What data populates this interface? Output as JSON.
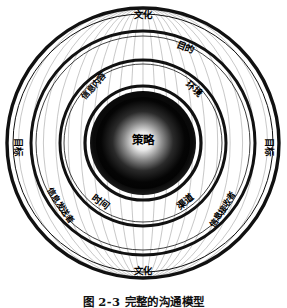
{
  "figure": {
    "title_caption": "图 2-3  完整的沟通模型",
    "core": {
      "label": "策略"
    },
    "rings": [
      {
        "id": "ring-outer",
        "labels": [
          {
            "name": "culture-top",
            "text": "文化",
            "angle_deg": -90,
            "radius": 128,
            "rotate": 0
          },
          {
            "name": "culture-bottom",
            "text": "文化",
            "angle_deg": 90,
            "radius": 128,
            "rotate": 0
          },
          {
            "name": "goal-left",
            "text": "目标",
            "angle_deg": 178,
            "radius": 126,
            "rotate": 90
          },
          {
            "name": "goal-right",
            "text": "目标",
            "angle_deg": 2,
            "radius": 126,
            "rotate": 90
          }
        ]
      },
      {
        "id": "ring-second",
        "labels": [
          {
            "name": "purpose",
            "text": "目的",
            "angle_deg": -66,
            "radius": 104,
            "rotate": 22
          },
          {
            "name": "message-sender",
            "text": "信息发送者",
            "angle_deg": 143,
            "radius": 104,
            "rotate": 56
          },
          {
            "name": "message-receiver",
            "text": "信息接收者",
            "angle_deg": 40,
            "radius": 104,
            "rotate": -56
          }
        ]
      },
      {
        "id": "ring-third",
        "labels": [
          {
            "name": "message-content",
            "text": "信息内容",
            "angle_deg": -131,
            "radius": 75,
            "rotate": -50
          },
          {
            "name": "environment",
            "text": "环境",
            "angle_deg": -47,
            "radius": 74,
            "rotate": 43
          },
          {
            "name": "time",
            "text": "时间",
            "angle_deg": 126,
            "radius": 73,
            "rotate": 38
          },
          {
            "name": "channel",
            "text": "渠道",
            "angle_deg": 54,
            "radius": 73,
            "rotate": -38
          }
        ]
      }
    ],
    "geometry": {
      "center_x": 143,
      "center_y": 143,
      "outer_rx": 137,
      "outer_ry": 136,
      "meridian_count": 22
    },
    "colors": {
      "ring_stroke": "#111111",
      "meridian_stroke": "#9a9a9a",
      "core_dark": "#000000",
      "core_highlight": "#f2f2f2",
      "background": "#ffffff",
      "label_text": "#000000"
    }
  }
}
